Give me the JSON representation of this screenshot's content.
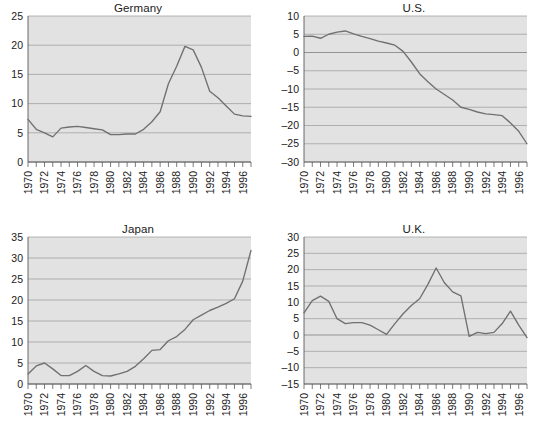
{
  "figure": {
    "background_color": "#ffffff",
    "plot_background_color": "#e2e2e2",
    "line_color": "#707070",
    "grid_color": "#9a9a9a",
    "axis_color": "#5a5a5a"
  },
  "panels": [
    {
      "id": "germany",
      "title": "Germany"
    },
    {
      "id": "us",
      "title": "U.S."
    },
    {
      "id": "japan",
      "title": "Japan"
    },
    {
      "id": "uk",
      "title": "U.K."
    }
  ],
  "chart_data": [
    {
      "type": "line",
      "title": "Germany",
      "xlabel": "",
      "ylabel": "",
      "xlim": [
        1970,
        1997
      ],
      "ylim": [
        0,
        25
      ],
      "yticks": [
        0,
        5,
        10,
        15,
        20,
        25
      ],
      "ytick_labels": [
        "0",
        "5",
        "10",
        "15",
        "20",
        "25"
      ],
      "xticks": [
        1970,
        1971,
        1972,
        1973,
        1974,
        1975,
        1976,
        1977,
        1978,
        1979,
        1980,
        1981,
        1982,
        1983,
        1984,
        1985,
        1986,
        1987,
        1988,
        1989,
        1990,
        1991,
        1992,
        1993,
        1994,
        1995,
        1996,
        1997
      ],
      "xtick_labels": [
        "1970",
        "",
        "1972",
        "",
        "1974",
        "",
        "1976",
        "",
        "1978",
        "",
        "1980",
        "",
        "1982",
        "",
        "1984",
        "",
        "1986",
        "",
        "1988",
        "",
        "1990",
        "",
        "1992",
        "",
        "1994",
        "",
        "1996",
        ""
      ],
      "grid": true,
      "legend": "none",
      "x": [
        1970,
        1971,
        1972,
        1973,
        1974,
        1975,
        1976,
        1977,
        1978,
        1979,
        1980,
        1981,
        1982,
        1983,
        1984,
        1985,
        1986,
        1987,
        1988,
        1989,
        1990,
        1991,
        1992,
        1993,
        1994,
        1995,
        1996,
        1997
      ],
      "values": [
        7.3,
        5.6,
        5.0,
        4.3,
        5.8,
        6.0,
        6.1,
        5.9,
        5.7,
        5.5,
        4.7,
        4.7,
        4.8,
        4.8,
        5.6,
        6.9,
        8.6,
        13.4,
        16.4,
        19.8,
        19.2,
        16.2,
        12.1,
        11.0,
        9.6,
        8.2,
        7.9,
        7.8
      ]
    },
    {
      "type": "line",
      "title": "U.S.",
      "xlabel": "",
      "ylabel": "",
      "xlim": [
        1970,
        1997
      ],
      "ylim": [
        -30,
        10
      ],
      "yticks": [
        -30,
        -25,
        -20,
        -15,
        -10,
        -5,
        0,
        5,
        10
      ],
      "ytick_labels": [
        "–30",
        "–25",
        "–20",
        "–15",
        "–10",
        "–5",
        "0",
        "5",
        "10"
      ],
      "xticks": [
        1970,
        1971,
        1972,
        1973,
        1974,
        1975,
        1976,
        1977,
        1978,
        1979,
        1980,
        1981,
        1982,
        1983,
        1984,
        1985,
        1986,
        1987,
        1988,
        1989,
        1990,
        1991,
        1992,
        1993,
        1994,
        1995,
        1996,
        1997
      ],
      "xtick_labels": [
        "1970",
        "",
        "1972",
        "",
        "1974",
        "",
        "1976",
        "",
        "1978",
        "",
        "1980",
        "",
        "1982",
        "",
        "1984",
        "",
        "1986",
        "",
        "1988",
        "",
        "1990",
        "",
        "1992",
        "",
        "1994",
        "",
        "1996",
        ""
      ],
      "grid": true,
      "legend": "none",
      "x": [
        1970,
        1971,
        1972,
        1973,
        1974,
        1975,
        1976,
        1977,
        1978,
        1979,
        1980,
        1981,
        1982,
        1983,
        1984,
        1985,
        1986,
        1987,
        1988,
        1989,
        1990,
        1991,
        1992,
        1993,
        1994,
        1995,
        1996,
        1997
      ],
      "values": [
        4.4,
        4.5,
        3.9,
        5.0,
        5.6,
        5.9,
        5.1,
        4.4,
        3.8,
        3.1,
        2.6,
        2.0,
        0.3,
        -2.6,
        -5.8,
        -8.0,
        -10.0,
        -11.5,
        -13.0,
        -15.0,
        -15.6,
        -16.3,
        -16.8,
        -17.0,
        -17.3,
        -19.3,
        -21.6,
        -25.0
      ]
    },
    {
      "type": "line",
      "title": "Japan",
      "xlabel": "",
      "ylabel": "",
      "xlim": [
        1970,
        1997
      ],
      "ylim": [
        0,
        35
      ],
      "yticks": [
        0,
        5,
        10,
        15,
        20,
        25,
        30,
        35
      ],
      "ytick_labels": [
        "0",
        "5",
        "10",
        "15",
        "20",
        "25",
        "30",
        "35"
      ],
      "xticks": [
        1970,
        1971,
        1972,
        1973,
        1974,
        1975,
        1976,
        1977,
        1978,
        1979,
        1980,
        1981,
        1982,
        1983,
        1984,
        1985,
        1986,
        1987,
        1988,
        1989,
        1990,
        1991,
        1992,
        1993,
        1994,
        1995,
        1996,
        1997
      ],
      "xtick_labels": [
        "1970",
        "",
        "1972",
        "",
        "1974",
        "",
        "1976",
        "",
        "1978",
        "",
        "1980",
        "",
        "1982",
        "",
        "1984",
        "",
        "1986",
        "",
        "1988",
        "",
        "1990",
        "",
        "1992",
        "",
        "1994",
        "",
        "1996",
        ""
      ],
      "grid": true,
      "legend": "none",
      "x": [
        1970,
        1971,
        1972,
        1973,
        1974,
        1975,
        1976,
        1977,
        1978,
        1979,
        1980,
        1981,
        1982,
        1983,
        1984,
        1985,
        1986,
        1987,
        1988,
        1989,
        1990,
        1991,
        1992,
        1993,
        1994,
        1995,
        1996,
        1997
      ],
      "values": [
        2.4,
        4.3,
        5.0,
        3.6,
        2.0,
        2.0,
        3.0,
        4.4,
        3.0,
        2.0,
        1.9,
        2.4,
        3.0,
        4.2,
        6.0,
        8.0,
        8.2,
        10.3,
        11.3,
        13.0,
        15.3,
        16.4,
        17.5,
        18.3,
        19.2,
        20.3,
        24.5,
        31.8
      ]
    },
    {
      "type": "line",
      "title": "U.K.",
      "xlabel": "",
      "ylabel": "",
      "xlim": [
        1970,
        1997
      ],
      "ylim": [
        -15,
        30
      ],
      "yticks": [
        -15,
        -10,
        -5,
        0,
        5,
        10,
        15,
        20,
        25,
        30
      ],
      "ytick_labels": [
        "–15",
        "–10",
        "–5",
        "0",
        "5",
        "10",
        "15",
        "20",
        "25",
        "30"
      ],
      "xticks": [
        1970,
        1971,
        1972,
        1973,
        1974,
        1975,
        1976,
        1977,
        1978,
        1979,
        1980,
        1981,
        1982,
        1983,
        1984,
        1985,
        1986,
        1987,
        1988,
        1989,
        1990,
        1991,
        1992,
        1993,
        1994,
        1995,
        1996,
        1997
      ],
      "xtick_labels": [
        "1970",
        "",
        "1972",
        "",
        "1974",
        "",
        "1976",
        "",
        "1978",
        "",
        "1980",
        "",
        "1982",
        "",
        "1984",
        "",
        "1986",
        "",
        "1988",
        "",
        "1990",
        "",
        "1992",
        "",
        "1994",
        "",
        "1996",
        ""
      ],
      "grid": true,
      "legend": "none",
      "x": [
        1970,
        1971,
        1972,
        1973,
        1974,
        1975,
        1976,
        1977,
        1978,
        1979,
        1980,
        1981,
        1982,
        1983,
        1984,
        1985,
        1986,
        1987,
        1988,
        1989,
        1990,
        1991,
        1992,
        1993,
        1994,
        1995,
        1996,
        1997
      ],
      "values": [
        6.8,
        10.5,
        11.9,
        10.3,
        5.0,
        3.5,
        3.8,
        3.8,
        3.0,
        1.6,
        0.2,
        3.5,
        6.5,
        9.0,
        11.1,
        15.5,
        20.5,
        16.0,
        13.2,
        12.0,
        -0.4,
        0.8,
        0.4,
        0.8,
        3.5,
        7.3,
        3.0,
        -0.8
      ]
    }
  ]
}
